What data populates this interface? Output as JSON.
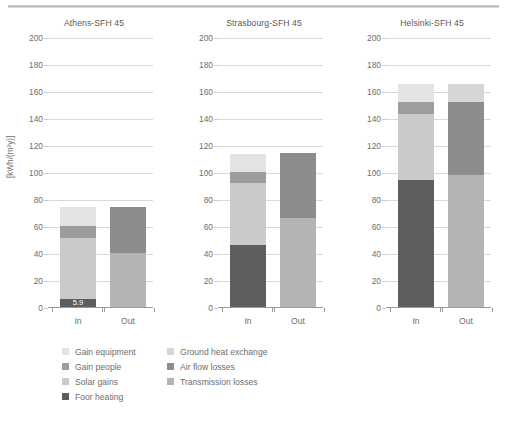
{
  "figure": {
    "ylabel": "[kWh/(m²y)]",
    "y_ticks": [
      0,
      20,
      40,
      60,
      80,
      100,
      120,
      140,
      160,
      180,
      200
    ],
    "ylim": [
      0,
      200
    ],
    "x_categories": [
      "In",
      "Out"
    ]
  },
  "legend": {
    "column1": [
      {
        "label": "Gain equipment",
        "color": "#e4e4e4"
      },
      {
        "label": "Gain people",
        "color": "#9d9d9d"
      },
      {
        "label": "Solar gains",
        "color": "#cacaca"
      }
    ],
    "column2": [
      {
        "label": "Ground heat exchange",
        "color": "#d6d6d6"
      },
      {
        "label": "Air flow losses",
        "color": "#8c8c8c"
      },
      {
        "label": "Transmission losses",
        "color": "#b4b4b4"
      }
    ],
    "bottom": [
      {
        "label": "Foor heating",
        "color": "#5e5e5e"
      }
    ]
  },
  "chart_data": {
    "type": "bar",
    "title": "",
    "xlabel": "",
    "ylabel": "[kWh/(m²y)]",
    "ylim": [
      0,
      200
    ],
    "y_ticks": [
      0,
      20,
      40,
      60,
      80,
      100,
      120,
      140,
      160,
      180,
      200
    ],
    "grid": true,
    "stacked": true,
    "legend_position": "bottom-left",
    "panels": [
      {
        "title": "Athens-SFH 45",
        "categories": [
          "In",
          "Out"
        ],
        "bars": [
          {
            "category": "In",
            "total": 74,
            "segments": [
              {
                "name": "Foor heating",
                "value": 5.9,
                "color": "#5e5e5e",
                "label": "5.9"
              },
              {
                "name": "Solar gains",
                "value": 45.1,
                "color": "#cacaca"
              },
              {
                "name": "Gain people",
                "value": 9.0,
                "color": "#9d9d9d"
              },
              {
                "name": "Gain equipment",
                "value": 14.0,
                "color": "#e4e4e4"
              }
            ]
          },
          {
            "category": "Out",
            "total": 74,
            "segments": [
              {
                "name": "Transmission losses",
                "value": 40.0,
                "color": "#b4b4b4"
              },
              {
                "name": "Air flow losses",
                "value": 34.0,
                "color": "#8c8c8c"
              }
            ]
          }
        ]
      },
      {
        "title": "Strasbourg-SFH 45",
        "categories": [
          "In",
          "Out"
        ],
        "bars": [
          {
            "category": "In",
            "total": 113,
            "segments": [
              {
                "name": "Foor heating",
                "value": 46.0,
                "color": "#5e5e5e"
              },
              {
                "name": "Solar gains",
                "value": 46.0,
                "color": "#cacaca"
              },
              {
                "name": "Gain people",
                "value": 8.0,
                "color": "#9d9d9d"
              },
              {
                "name": "Gain equipment",
                "value": 13.0,
                "color": "#e4e4e4"
              }
            ]
          },
          {
            "category": "Out",
            "total": 114,
            "segments": [
              {
                "name": "Transmission losses",
                "value": 66.0,
                "color": "#b4b4b4"
              },
              {
                "name": "Air flow losses",
                "value": 48.0,
                "color": "#8c8c8c"
              }
            ]
          }
        ]
      },
      {
        "title": "Helsinki-SFH 45",
        "categories": [
          "In",
          "Out"
        ],
        "bars": [
          {
            "category": "In",
            "total": 165,
            "segments": [
              {
                "name": "Foor heating",
                "value": 94.0,
                "color": "#5e5e5e"
              },
              {
                "name": "Solar gains",
                "value": 49.0,
                "color": "#cacaca"
              },
              {
                "name": "Gain people",
                "value": 9.0,
                "color": "#9d9d9d"
              },
              {
                "name": "Gain equipment",
                "value": 13.0,
                "color": "#e4e4e4"
              }
            ]
          },
          {
            "category": "Out",
            "total": 165,
            "segments": [
              {
                "name": "Transmission losses",
                "value": 98.0,
                "color": "#b4b4b4"
              },
              {
                "name": "Air flow losses",
                "value": 54.0,
                "color": "#8c8c8c"
              },
              {
                "name": "Ground heat exchange",
                "value": 13.0,
                "color": "#d6d6d6"
              }
            ]
          }
        ]
      }
    ]
  }
}
